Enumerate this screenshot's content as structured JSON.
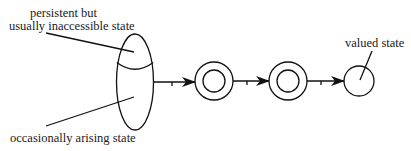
{
  "diagram": {
    "labels": {
      "persistent_line1": "persistent but",
      "persistent_line2": "usually inaccessible state",
      "occasional": "occasionally arising state",
      "valued": "valued state"
    },
    "nodes": [
      {
        "id": "compound-state",
        "shape": "ellipse-split",
        "regions": [
          "persistent but usually inaccessible state",
          "occasionally arising state"
        ]
      },
      {
        "id": "intermediate-state-1",
        "shape": "double-circle"
      },
      {
        "id": "intermediate-state-2",
        "shape": "double-circle"
      },
      {
        "id": "valued-state",
        "shape": "circle",
        "label": "valued state"
      }
    ],
    "edges": [
      {
        "from": "compound-state",
        "to": "intermediate-state-1",
        "style": "arrow-with-tick"
      },
      {
        "from": "intermediate-state-1",
        "to": "intermediate-state-2",
        "style": "arrow-with-tick"
      },
      {
        "from": "intermediate-state-2",
        "to": "valued-state",
        "style": "arrow-with-tick"
      }
    ],
    "colors": {
      "line": "#111111",
      "background": "#ffffff"
    }
  }
}
